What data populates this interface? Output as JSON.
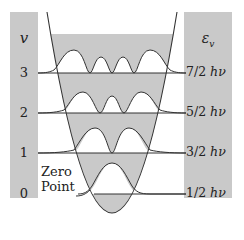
{
  "diagram": {
    "left_column": {
      "header": "v",
      "levels": [
        "3",
        "2",
        "1",
        "0"
      ]
    },
    "right_column": {
      "header": "ε",
      "header_subscript": "v",
      "levels": [
        {
          "num": "7/2",
          "unit": "hν"
        },
        {
          "num": "5/2",
          "unit": "hν"
        },
        {
          "num": "3/2",
          "unit": "hν"
        },
        {
          "num": "1/2",
          "unit": "hν"
        }
      ]
    },
    "annotation": {
      "line1": "Zero",
      "line2": "Point"
    },
    "colors": {
      "shade": "#c9c9c9",
      "line": "#333333",
      "background": "#ffffff"
    },
    "level_y": [
      73,
      113,
      153,
      194
    ]
  }
}
